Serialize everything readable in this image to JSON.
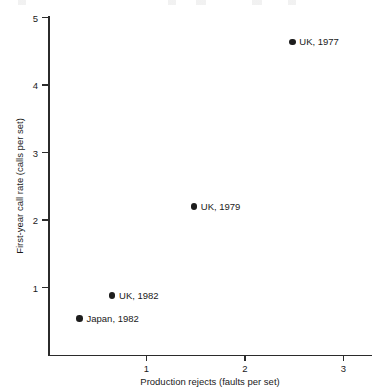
{
  "chart_data": {
    "type": "scatter",
    "title": "",
    "xlabel": "Production rejects (faults per set)",
    "ylabel": "First-year call rate (calls per set)",
    "xlim": [
      0,
      3.3
    ],
    "ylim": [
      0,
      5.1
    ],
    "xticks": [
      1,
      2,
      3
    ],
    "xtick_labels": [
      "1",
      "2",
      "3"
    ],
    "yticks": [
      1,
      2,
      3,
      4,
      5
    ],
    "ytick_labels": [
      "1",
      "2",
      "3",
      "4",
      "5"
    ],
    "grid": false,
    "legend": "none",
    "marker_color": "#1d1d1d",
    "axis_color": "#2b2b2b",
    "background_color": "#ffffff",
    "points": [
      {
        "label": "UK, 1977",
        "x": 2.48,
        "y": 4.64
      },
      {
        "label": "UK, 1979",
        "x": 1.48,
        "y": 2.2
      },
      {
        "label": "UK, 1982",
        "x": 0.65,
        "y": 0.88
      },
      {
        "label": "Japan, 1982",
        "x": 0.32,
        "y": 0.54
      }
    ]
  },
  "plot_geometry": {
    "origin_x_px": 48,
    "origin_y_px": 355,
    "px_per_x_unit": 98.5,
    "px_per_y_unit": 67.5
  }
}
